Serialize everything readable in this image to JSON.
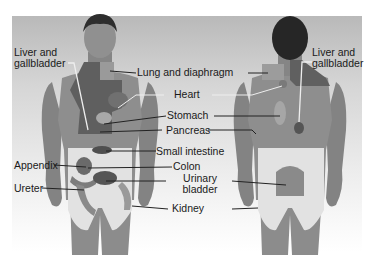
{
  "figure": {
    "views": [
      "front",
      "back"
    ],
    "labels": {
      "front_left": {
        "liver_gallbladder_line1": "Liver and",
        "liver_gallbladder_line2": "gallbladder",
        "appendix": "Appendix",
        "ureter": "Ureter"
      },
      "center": {
        "lung_diaphragm": "Lung and diaphragm",
        "heart": "Heart",
        "stomach": "Stomach",
        "pancreas": "Pancreas",
        "small_intestine": "Small intestine",
        "colon": "Colon",
        "urinary_bladder_line1": "Urinary",
        "urinary_bladder_line2": "bladder",
        "kidney": "Kidney"
      },
      "back_right": {
        "liver_gallbladder_line1": "Liver and",
        "liver_gallbladder_line2": "gallbladder"
      }
    },
    "colors": {
      "skin": "#8a8a8a",
      "skin_dark": "#6e6e6e",
      "hair": "#2b2b2b",
      "referred_zone_dark": "#5e5e5e",
      "referred_zone_light": "#dcdcdc",
      "leader_line": "#222222"
    }
  }
}
